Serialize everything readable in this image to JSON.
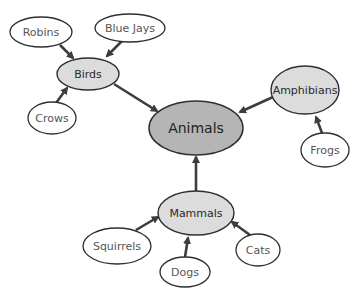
{
  "diagram": {
    "type": "concept-map",
    "title_partial": "",
    "colors": {
      "edge": "#3d3d3d",
      "root_fill": "#b5b5b5",
      "category_fill": "#dcdcdc",
      "leaf_fill": "#ffffff",
      "outline": "#2e2e2e"
    },
    "root": {
      "id": "animals",
      "label": "Animals"
    },
    "categories": [
      {
        "id": "birds",
        "label": "Birds"
      },
      {
        "id": "amphibians",
        "label": "Amphibians"
      },
      {
        "id": "mammals",
        "label": "Mammals"
      }
    ],
    "leaves": [
      {
        "id": "robins",
        "label": "Robins",
        "parent": "birds"
      },
      {
        "id": "blue-jays",
        "label": "Blue Jays",
        "parent": "birds"
      },
      {
        "id": "crows",
        "label": "Crows",
        "parent": "birds"
      },
      {
        "id": "frogs",
        "label": "Frogs",
        "parent": "amphibians"
      },
      {
        "id": "squirrels",
        "label": "Squirrels",
        "parent": "mammals"
      },
      {
        "id": "dogs",
        "label": "Dogs",
        "parent": "mammals"
      },
      {
        "id": "cats",
        "label": "Cats",
        "parent": "mammals"
      }
    ],
    "edges": [
      {
        "from": "robins",
        "to": "birds"
      },
      {
        "from": "blue-jays",
        "to": "birds"
      },
      {
        "from": "crows",
        "to": "birds"
      },
      {
        "from": "birds",
        "to": "animals"
      },
      {
        "from": "frogs",
        "to": "amphibians"
      },
      {
        "from": "amphibians",
        "to": "animals"
      },
      {
        "from": "squirrels",
        "to": "mammals"
      },
      {
        "from": "dogs",
        "to": "mammals"
      },
      {
        "from": "cats",
        "to": "mammals"
      },
      {
        "from": "mammals",
        "to": "animals"
      }
    ]
  }
}
